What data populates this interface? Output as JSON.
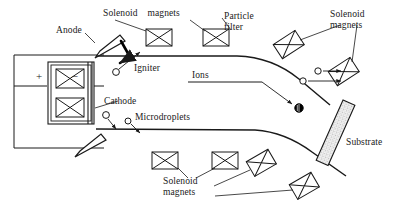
{
  "diagram": {
    "colors": {
      "line": "#1a1a1a",
      "fill_white": "#ffffff",
      "ion_fill": "#000000",
      "substrate_fill": "#f2f2f2"
    },
    "labels": {
      "anode": "Anode",
      "cathode": "Cathode",
      "igniter": "Igniter",
      "microdroplets": "Microdroplets",
      "ions": "Ions",
      "particle_filter": "Particle\nfilter",
      "substrate": "Substrate",
      "solenoid_magnets_top": "Solenoid    magnets",
      "solenoid_magnets_right": "Solenoid\nmagnets",
      "solenoid_magnets_bottom": "Solenoid\nmagnets",
      "battery_plus": "+",
      "battery_minus": "–"
    },
    "elements": {
      "solenoid_count_top_wall": 2,
      "solenoid_count_bottom_wall": 2,
      "solenoid_count_upper_curve": 2,
      "solenoid_count_lower_curve": 2,
      "solenoid_count_source_chamber": 2,
      "ion_particle_count": 1,
      "microdroplet_count": 2,
      "arrow_particle_count": 2
    }
  }
}
